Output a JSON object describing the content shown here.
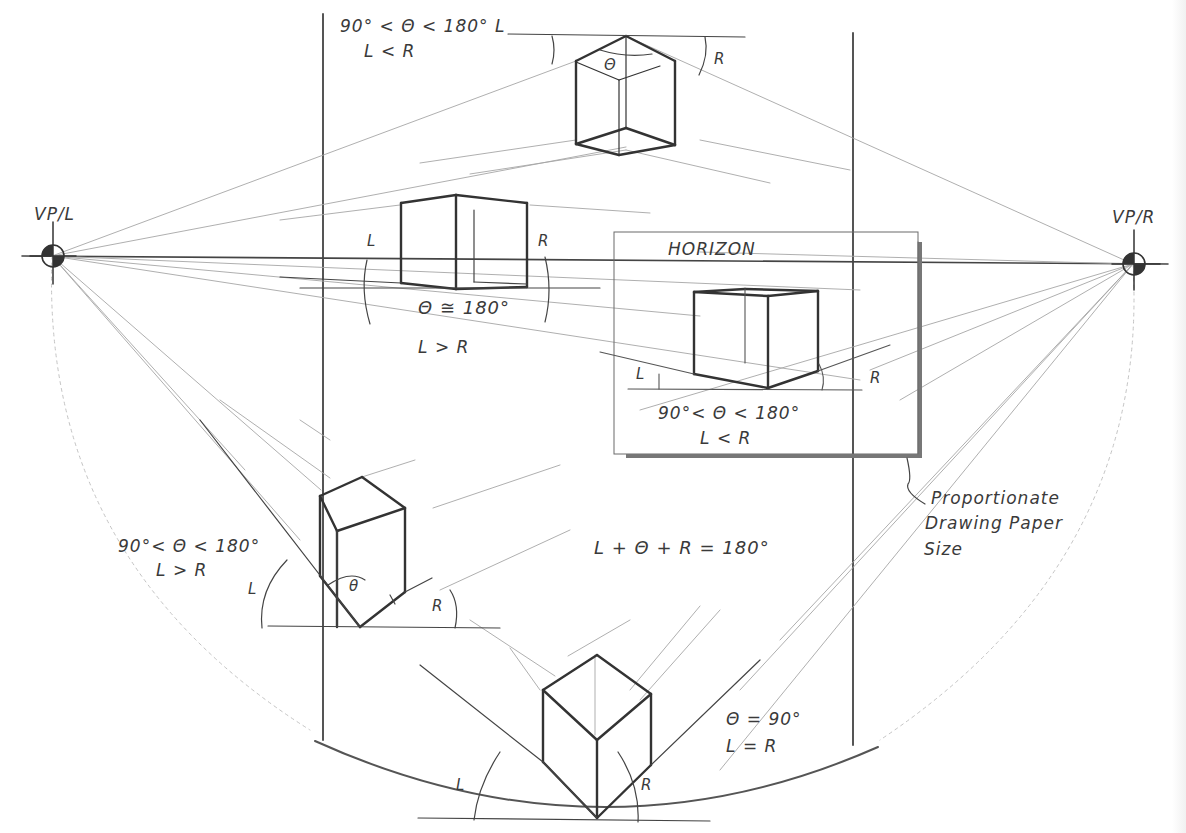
{
  "figure": {
    "type": "two-point perspective diagram",
    "vanishing_points": {
      "left": {
        "label": "VP/L",
        "x": 52,
        "y": 256
      },
      "right": {
        "label": "VP/R",
        "x": 1133,
        "y": 264
      }
    },
    "horizon": {
      "label": "HORIZON"
    },
    "equation": "L + Θ + R = 180°",
    "paper_note": {
      "line1": "Proportionate",
      "line2": "Drawing Paper",
      "line3": "Size"
    },
    "cubes": [
      {
        "id": "top",
        "condition_line1": "90° < Θ < 180° L",
        "condition_line2": "L < R",
        "angle_theta": "Θ",
        "angle_right": "R"
      },
      {
        "id": "near-horizon",
        "angle_left": "L",
        "angle_right": "R",
        "condition_line1": "Θ ≅ 180°",
        "condition_line2": "L > R"
      },
      {
        "id": "inset-paper",
        "angle_left": "L",
        "angle_right": "R",
        "condition_line1": "90°< Θ < 180°",
        "condition_line2": "L < R"
      },
      {
        "id": "lower-left",
        "condition_line1": "90°< Θ < 180°",
        "condition_line2": "L > R",
        "angle_left": "L",
        "angle_theta": "θ",
        "angle_right": "R"
      },
      {
        "id": "bottom",
        "condition_line1": "Θ = 90°",
        "condition_line2": "L = R",
        "angle_left": "L",
        "angle_right": "R"
      }
    ]
  },
  "colors": {
    "ink": "#333333",
    "construction": "#9a9a9a",
    "paper": "#ffffff",
    "shadow": "#6a6a6a"
  }
}
